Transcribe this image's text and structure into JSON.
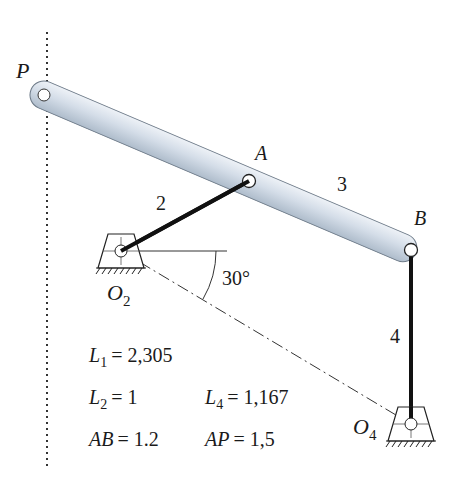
{
  "diagram": {
    "type": "four-bar linkage",
    "points": {
      "P": {
        "label": "P",
        "x": 44,
        "y": 95
      },
      "A": {
        "label": "A",
        "x": 249,
        "y": 181
      },
      "B": {
        "label": "B",
        "x": 411,
        "y": 250
      },
      "O2": {
        "label": "O",
        "sub": "2",
        "x": 121,
        "y": 251
      },
      "O4": {
        "label": "O",
        "sub": "4",
        "x": 411,
        "y": 424
      }
    },
    "links": {
      "link2": {
        "label": "2"
      },
      "link3": {
        "label": "3"
      },
      "link4": {
        "label": "4"
      }
    },
    "angle": {
      "label": "30°"
    },
    "params": {
      "L1": {
        "sym": "L",
        "sub": "1",
        "value": "= 2,305"
      },
      "L2": {
        "sym": "L",
        "sub": "2",
        "value": "= 1"
      },
      "L4": {
        "sym": "L",
        "sub": "4",
        "value": "= 1,167"
      },
      "AB": {
        "sym": "AB",
        "value": "= 1.2"
      },
      "AP": {
        "sym": "AP",
        "value": "= 1,5"
      }
    },
    "colors": {
      "link3_fill": "#c9d5e2",
      "link3_stroke": "#6d7a88",
      "link_dark": "#111111",
      "ground_line": "#333333"
    }
  }
}
